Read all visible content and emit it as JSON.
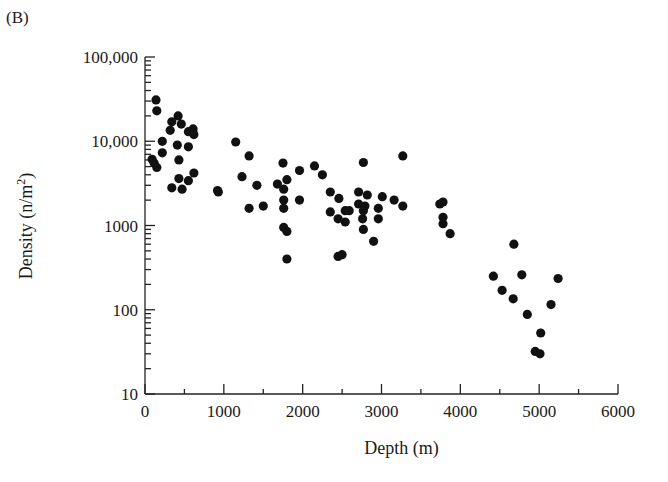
{
  "figure": {
    "panel_label": "(B)"
  },
  "chart_data": {
    "type": "scatter",
    "title": "",
    "xlabel": "Depth (m)",
    "ylabel": "Density (n/m2)",
    "ylabel_parts": {
      "main": "Density (n/m",
      "sup": "2",
      "end": ")"
    },
    "xlim": [
      0,
      6000
    ],
    "ylim": [
      10,
      100000
    ],
    "yscale": "log",
    "grid": false,
    "legend": null,
    "x_ticks": [
      0,
      1000,
      2000,
      3000,
      4000,
      5000,
      6000
    ],
    "x_tick_labels": [
      "0",
      "1000",
      "2000",
      "3000",
      "4000",
      "5000",
      "6000"
    ],
    "x_minor_ticks": [
      500,
      1500,
      2500,
      3500,
      4500,
      5500
    ],
    "y_ticks": [
      10,
      100,
      1000,
      10000,
      100000
    ],
    "y_tick_labels": [
      "10",
      "100",
      "1000",
      "10,000",
      "100,000"
    ],
    "marker": {
      "shape": "circle",
      "color": "#111111",
      "radius": 4.6
    },
    "points": [
      [
        140,
        31000
      ],
      [
        150,
        23000
      ],
      [
        420,
        20000
      ],
      [
        340,
        17000
      ],
      [
        460,
        16000
      ],
      [
        320,
        13500
      ],
      [
        550,
        13000
      ],
      [
        610,
        14000
      ],
      [
        620,
        12000
      ],
      [
        220,
        10000
      ],
      [
        410,
        9000
      ],
      [
        550,
        8600
      ],
      [
        220,
        7300
      ],
      [
        430,
        6000
      ],
      [
        90,
        6100
      ],
      [
        115,
        5500
      ],
      [
        150,
        4900
      ],
      [
        620,
        4200
      ],
      [
        430,
        3600
      ],
      [
        550,
        3400
      ],
      [
        340,
        2800
      ],
      [
        470,
        2700
      ],
      [
        930,
        2500
      ],
      [
        1150,
        9800
      ],
      [
        1320,
        6700
      ],
      [
        1230,
        3800
      ],
      [
        920,
        2600
      ],
      [
        1420,
        3000
      ],
      [
        1320,
        1600
      ],
      [
        1500,
        1700
      ],
      [
        1750,
        5500
      ],
      [
        1680,
        3100
      ],
      [
        1800,
        3500
      ],
      [
        1760,
        2700
      ],
      [
        1760,
        2000
      ],
      [
        1760,
        1600
      ],
      [
        1960,
        2000
      ],
      [
        1960,
        4500
      ],
      [
        2150,
        5100
      ],
      [
        2250,
        4000
      ],
      [
        1760,
        950
      ],
      [
        1800,
        850
      ],
      [
        1800,
        400
      ],
      [
        2350,
        2500
      ],
      [
        2460,
        2100
      ],
      [
        2350,
        1450
      ],
      [
        2540,
        1500
      ],
      [
        2590,
        1500
      ],
      [
        2450,
        1200
      ],
      [
        2540,
        1100
      ],
      [
        2710,
        2500
      ],
      [
        2820,
        2300
      ],
      [
        2710,
        1800
      ],
      [
        2790,
        1700
      ],
      [
        2770,
        1500
      ],
      [
        2760,
        1200
      ],
      [
        2770,
        900
      ],
      [
        3010,
        2200
      ],
      [
        2960,
        1600
      ],
      [
        2960,
        1200
      ],
      [
        3160,
        2000
      ],
      [
        3270,
        1700
      ],
      [
        2900,
        650
      ],
      [
        2770,
        5600
      ],
      [
        3270,
        6700
      ],
      [
        2450,
        430
      ],
      [
        2500,
        450
      ],
      [
        3740,
        1800
      ],
      [
        3780,
        1900
      ],
      [
        3780,
        1250
      ],
      [
        3780,
        1050
      ],
      [
        3870,
        800
      ],
      [
        4680,
        600
      ],
      [
        4420,
        250
      ],
      [
        4780,
        260
      ],
      [
        5240,
        235
      ],
      [
        4530,
        170
      ],
      [
        4670,
        135
      ],
      [
        5150,
        115
      ],
      [
        4850,
        88
      ],
      [
        5020,
        53
      ],
      [
        4950,
        32
      ],
      [
        5010,
        30
      ]
    ]
  }
}
